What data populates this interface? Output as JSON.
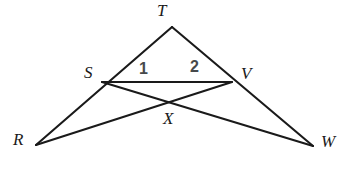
{
  "figure": {
    "width": 352,
    "height": 173,
    "background_color": "#ffffff",
    "line_color": "#1a1a1a",
    "line_width": 2.1,
    "vertex_label_color": "#1a1a1a",
    "angle_label_color": "#46494b"
  },
  "points": [
    {
      "id": "T",
      "label": "T",
      "x": 172,
      "y": 27,
      "label_x": 157,
      "label_y": 2
    },
    {
      "id": "S",
      "label": "S",
      "x": 102,
      "y": 82,
      "label_x": 84,
      "label_y": 64
    },
    {
      "id": "V",
      "label": "V",
      "x": 232,
      "y": 82,
      "label_x": 241,
      "label_y": 65
    },
    {
      "id": "R",
      "label": "R",
      "x": 36,
      "y": 145,
      "label_x": 13,
      "label_y": 131
    },
    {
      "id": "W",
      "label": "W",
      "x": 313,
      "y": 146,
      "label_x": 321,
      "label_y": 133
    },
    {
      "id": "X",
      "label": "X",
      "x": 172,
      "y": 105,
      "label_x": 163,
      "label_y": 110
    }
  ],
  "segments": [
    {
      "id": "RT",
      "from": "R",
      "to": "T",
      "d": "M 36 145 L 172 27"
    },
    {
      "id": "TW",
      "from": "T",
      "to": "W",
      "d": "M 172 27 L 313 146"
    },
    {
      "id": "SV",
      "from": "S",
      "to": "V",
      "d": "M 102 82 L 232 82"
    },
    {
      "id": "SW",
      "from": "S",
      "to": "W",
      "d": "M 102 82 L 313 146"
    },
    {
      "id": "RV",
      "from": "R",
      "to": "V",
      "d": "M 36 145 L 232 82"
    }
  ],
  "angles": [
    {
      "id": "angle-1",
      "label": "1",
      "x": 139,
      "y": 61
    },
    {
      "id": "angle-2",
      "label": "2",
      "x": 190,
      "y": 59
    }
  ]
}
